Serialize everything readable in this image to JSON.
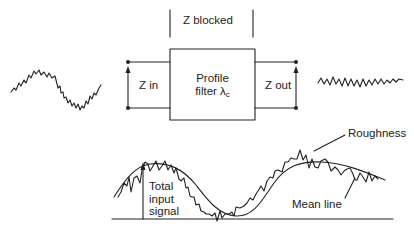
{
  "diagram": {
    "top": {
      "z_blocked_label": "Z blocked",
      "z_in_label": "Z in",
      "z_out_label": "Z out",
      "filter_label_line1": "Profile",
      "filter_label_line2": "filter λ",
      "filter_label_subscript": "c",
      "input_wave": "sinusoid-with-roughness",
      "output_wave": "roughness-only"
    },
    "bottom": {
      "roughness_label": "Roughness",
      "mean_line_label": "Mean line",
      "total_input_line1": "Total",
      "total_input_line2": "input",
      "total_input_line3": "signal"
    },
    "colors": {
      "stroke": "#222222",
      "background": "#ffffff"
    }
  }
}
